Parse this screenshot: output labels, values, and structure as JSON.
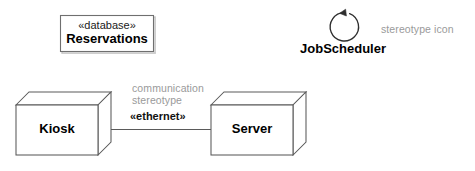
{
  "diagram": {
    "kind": "uml-deployment-diagram",
    "background_color": "#ffffff",
    "line_color": "#4a4a4a",
    "annotation_color": "#9a9a9a",
    "text_color": "#000000"
  },
  "artifact": {
    "stereotype": "«database»",
    "name": "Reservations"
  },
  "nodes": [
    {
      "name": "Kiosk"
    },
    {
      "name": "Server"
    }
  ],
  "connector": {
    "annotation_line1": "communication",
    "annotation_line2": "stereotype",
    "stereotype": "«ethernet»"
  },
  "stereotype_icon_element": {
    "name": "JobScheduler",
    "annotation": "stereotype icon",
    "icon": "circular-arrow-icon"
  }
}
